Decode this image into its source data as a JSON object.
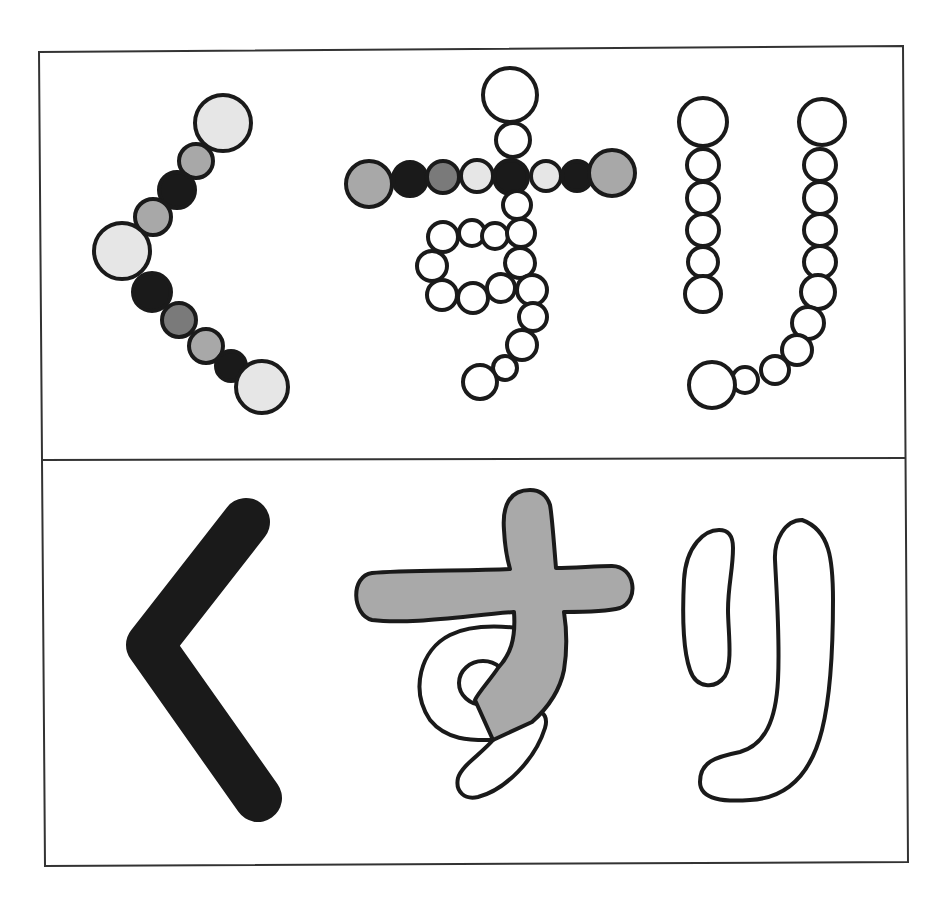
{
  "illustration": {
    "word": "くすり",
    "characters": [
      "く",
      "す",
      "り"
    ],
    "panels": [
      {
        "name": "top",
        "style": "chain of outlined circles"
      },
      {
        "name": "bottom",
        "style": "solid brush strokes"
      }
    ]
  },
  "colors": {
    "outline": "#1a1a1a",
    "black": "#1a1a1a",
    "dark_gray": "#7a7a7a",
    "mid_gray": "#a8a8a8",
    "light_gray": "#e6e6e6",
    "white": "#ffffff",
    "su_fill": "#a9a9a9"
  }
}
